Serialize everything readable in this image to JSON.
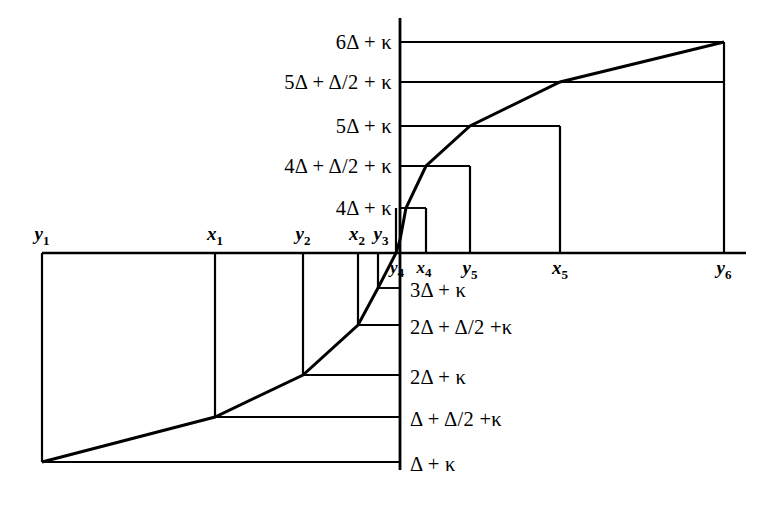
{
  "figure": {
    "kind": "mathematical-step-function-diagram",
    "symbols": {
      "delta": "Δ",
      "kappa": "κ",
      "half": "Δ/2"
    },
    "axes": {
      "vertical_axis_x": 400,
      "horizontal_axis_y": 253,
      "horizontal_axis_x_start": 42,
      "horizontal_axis_x_end": 746,
      "vertical_axis_y_top": 18,
      "vertical_axis_y_bottom": 470
    },
    "y_levels_above": [
      {
        "label": "6Δ + κ",
        "y": 42,
        "line_to_x": 724
      },
      {
        "label": "5Δ + Δ/2 + κ",
        "y": 82,
        "line_to_x": 724
      },
      {
        "label": "5Δ + κ",
        "y": 126,
        "line_to_x": 560
      },
      {
        "label": "4Δ + Δ/2 + κ",
        "y": 166,
        "line_to_x": 470
      },
      {
        "label": "4Δ + κ",
        "y": 208,
        "line_to_x": 426
      }
    ],
    "y_levels_below": [
      {
        "label": "3Δ + κ",
        "y": 288,
        "line_to_x": 378
      },
      {
        "label": "2Δ + Δ/2 +κ",
        "y": 325,
        "line_to_x": 358
      },
      {
        "label": "2Δ + κ",
        "y": 375,
        "line_to_x": 303
      },
      {
        "label": "Δ + Δ/2 +κ",
        "y": 417,
        "line_to_x": 215
      },
      {
        "label": "Δ + κ",
        "y": 462,
        "line_to_x": 42
      }
    ],
    "x_ticks": [
      {
        "label": "y",
        "sub": "1",
        "x": 42,
        "position": "above",
        "drop_to_y": 462
      },
      {
        "label": "x",
        "sub": "1",
        "x": 215,
        "position": "above",
        "drop_to_y": 417
      },
      {
        "label": "y",
        "sub": "2",
        "x": 303,
        "position": "above",
        "drop_to_y": 375
      },
      {
        "label": "x",
        "sub": "2",
        "x": 358,
        "position": "above",
        "drop_to_y": 325
      },
      {
        "label": "y",
        "sub": "3",
        "x": 378,
        "position": "above",
        "drop_to_y": 288
      },
      {
        "label": "y",
        "sub": "4",
        "x": 396,
        "position": "below",
        "drop_to_y": 208
      },
      {
        "label": "x",
        "sub": "4",
        "x": 426,
        "position": "below",
        "drop_to_y": 208
      },
      {
        "label": "y",
        "sub": "5",
        "x": 470,
        "position": "below",
        "drop_to_y": 166
      },
      {
        "label": "x",
        "sub": "5",
        "x": 560,
        "position": "below",
        "drop_to_y": 126
      },
      {
        "label": "y",
        "sub": "6",
        "x": 724,
        "position": "below",
        "drop_to_y": 42
      }
    ],
    "curve_vertices": [
      {
        "x": 42,
        "y": 462
      },
      {
        "x": 215,
        "y": 417
      },
      {
        "x": 303,
        "y": 375
      },
      {
        "x": 358,
        "y": 325
      },
      {
        "x": 378,
        "y": 288
      },
      {
        "x": 396,
        "y": 253
      },
      {
        "x": 400,
        "y": 240
      },
      {
        "x": 406,
        "y": 208
      },
      {
        "x": 426,
        "y": 166
      },
      {
        "x": 470,
        "y": 126
      },
      {
        "x": 560,
        "y": 82
      },
      {
        "x": 724,
        "y": 42
      }
    ],
    "stroke": {
      "axis_color": "#000000",
      "axis_width": 2.6,
      "grid_color": "#000000",
      "grid_width": 1.9,
      "curve_color": "#000000",
      "curve_width": 3.0
    }
  }
}
